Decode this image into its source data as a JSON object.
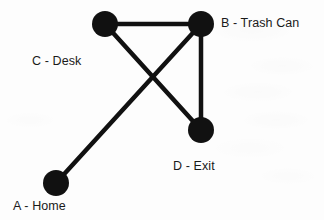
{
  "figure": {
    "kind": "undirected-node-link-graph",
    "background_color": "#fdfdfd",
    "node_color": "#111111",
    "edge_color": "#111111",
    "label_color": "#1a1a1a",
    "node_radius": 13,
    "edge_width": 4.5,
    "canvas": {
      "width": 324,
      "height": 220
    }
  },
  "nodes": [
    {
      "id": "A",
      "label": "A - Home",
      "cx": 56,
      "cy": 183,
      "label_x": 13,
      "label_y": 212
    },
    {
      "id": "B",
      "label": "B - Trash Can",
      "cx": 201,
      "cy": 24,
      "label_x": 221,
      "label_y": 29
    },
    {
      "id": "C",
      "label": "C - Desk",
      "cx": 105,
      "cy": 24,
      "label_x": 32,
      "label_y": 67
    },
    {
      "id": "D",
      "label": "D - Exit",
      "cx": 201,
      "cy": 130,
      "label_x": 173,
      "label_y": 172
    }
  ],
  "edges": [
    {
      "id": "edge-c-b",
      "from": "C",
      "to": "B",
      "x1": 105,
      "y1": 24,
      "x2": 201,
      "y2": 24
    },
    {
      "id": "edge-b-d",
      "from": "B",
      "to": "D",
      "x1": 201,
      "y1": 24,
      "x2": 201,
      "y2": 130
    },
    {
      "id": "edge-c-d",
      "from": "C",
      "to": "D",
      "x1": 105,
      "y1": 24,
      "x2": 201,
      "y2": 130
    },
    {
      "id": "edge-a-b",
      "from": "A",
      "to": "B",
      "x1": 56,
      "y1": 183,
      "x2": 201,
      "y2": 24
    }
  ],
  "crossings": [
    {
      "id": "crossing-cd-ab",
      "between": [
        "edge-c-d",
        "edge-a-b"
      ],
      "x": 158,
      "y": 83
    }
  ]
}
